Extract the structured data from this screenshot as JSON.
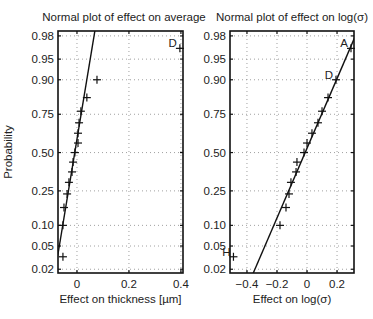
{
  "chart_data": [
    {
      "type": "scatter",
      "subtype": "normal-probability-plot",
      "title": "Normal plot of effect on average",
      "xlabel": "Effect on thickness [µm]",
      "ylabel": "Probability",
      "xlim": [
        -0.073,
        0.408
      ],
      "xticks": [
        0,
        0.2,
        0.4
      ],
      "xtick_labels": [
        "0",
        "0.2",
        "0.4"
      ],
      "yticks": [
        0.02,
        0.05,
        0.1,
        0.25,
        0.5,
        0.75,
        0.9,
        0.95,
        0.98
      ],
      "ytick_labels": [
        "0.02",
        "0.05",
        "0.10",
        "0.25",
        "0.50",
        "0.75",
        "0.90",
        "0.95",
        "0.98"
      ],
      "grid": true,
      "points": [
        {
          "x": -0.054,
          "p": 0.0333,
          "label": ""
        },
        {
          "x": -0.054,
          "p": 0.1,
          "label": ""
        },
        {
          "x": -0.05,
          "p": 0.1667,
          "label": ""
        },
        {
          "x": -0.038,
          "p": 0.2333,
          "label": ""
        },
        {
          "x": -0.031,
          "p": 0.3,
          "label": ""
        },
        {
          "x": -0.019,
          "p": 0.3667,
          "label": ""
        },
        {
          "x": -0.015,
          "p": 0.4333,
          "label": ""
        },
        {
          "x": -0.008,
          "p": 0.5,
          "label": ""
        },
        {
          "x": 0.004,
          "p": 0.5667,
          "label": ""
        },
        {
          "x": 0.004,
          "p": 0.6333,
          "label": ""
        },
        {
          "x": 0.008,
          "p": 0.7,
          "label": ""
        },
        {
          "x": 0.015,
          "p": 0.7667,
          "label": ""
        },
        {
          "x": 0.038,
          "p": 0.8333,
          "label": ""
        },
        {
          "x": 0.077,
          "p": 0.9,
          "label": ""
        },
        {
          "x": 0.396,
          "p": 0.9667,
          "label": "D"
        }
      ],
      "fit_line": {
        "x0": -0.073,
        "p0": 0.037,
        "x1": 0.069,
        "p1": 0.984
      }
    },
    {
      "type": "scatter",
      "subtype": "normal-probability-plot",
      "title": "Normal plot of effect on log(σ)",
      "xlabel": "Effect on log(σ)",
      "ylabel": "",
      "xlim": [
        -0.513,
        0.313
      ],
      "xticks": [
        -0.4,
        -0.2,
        0,
        0.2
      ],
      "xtick_labels": [
        "−0.4",
        "−0.2",
        "0",
        "0.2"
      ],
      "yticks": [
        0.02,
        0.05,
        0.1,
        0.25,
        0.5,
        0.75,
        0.9,
        0.95,
        0.98
      ],
      "ytick_labels": [
        "0.02",
        "0.05",
        "0.10",
        "0.25",
        "0.50",
        "0.75",
        "0.90",
        "0.95",
        "0.98"
      ],
      "grid": true,
      "points": [
        {
          "x": -0.49,
          "p": 0.0333,
          "label": "H"
        },
        {
          "x": -0.18,
          "p": 0.1,
          "label": ""
        },
        {
          "x": -0.14,
          "p": 0.1667,
          "label": ""
        },
        {
          "x": -0.12,
          "p": 0.2333,
          "label": ""
        },
        {
          "x": -0.107,
          "p": 0.3,
          "label": ""
        },
        {
          "x": -0.073,
          "p": 0.3667,
          "label": ""
        },
        {
          "x": -0.067,
          "p": 0.4333,
          "label": ""
        },
        {
          "x": -0.02,
          "p": 0.5,
          "label": ""
        },
        {
          "x": 0.0,
          "p": 0.5667,
          "label": ""
        },
        {
          "x": 0.033,
          "p": 0.6333,
          "label": ""
        },
        {
          "x": 0.073,
          "p": 0.7,
          "label": ""
        },
        {
          "x": 0.1,
          "p": 0.7667,
          "label": ""
        },
        {
          "x": 0.14,
          "p": 0.8333,
          "label": ""
        },
        {
          "x": 0.193,
          "p": 0.9,
          "label": "D"
        },
        {
          "x": 0.293,
          "p": 0.9667,
          "label": "A"
        }
      ],
      "fit_line": {
        "x0": -0.347,
        "p0": 0.02,
        "x1": 0.307,
        "p1": 0.975
      }
    }
  ]
}
